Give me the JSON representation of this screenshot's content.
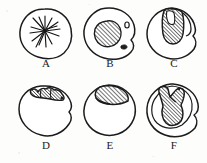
{
  "figure": {
    "background_color": "#fdfdfb",
    "ink_color": "#1b1b1b",
    "hatch_color": "#2a2a2a",
    "panel_count": 6,
    "rows": 2,
    "columns": 3,
    "label_font_style": "serif-capital"
  },
  "panels": [
    {
      "id": "A",
      "label": "A",
      "row": 1,
      "column": 1,
      "outline_shape": "irregular-rounded-circle",
      "content_name": "radiating-spindle-lines",
      "content_description": "cluster of straight lines radiating from a central point like an aster or spindle",
      "hatched": false,
      "satellite_marks": 0,
      "label_x": 46,
      "label_y": 63
    },
    {
      "id": "B",
      "label": "B",
      "row": 1,
      "column": 2,
      "outline_shape": "irregular-rounded-circle",
      "content_name": "central-hatched-blob",
      "content_description": "rounded diagonally hatched mass near the centre with two small satellite marks on the right",
      "hatched": true,
      "satellite_marks": 2,
      "label_x": 110,
      "label_y": 63
    },
    {
      "id": "C",
      "label": "C",
      "row": 1,
      "column": 3,
      "outline_shape": "irregular-circle-with-right-notch",
      "content_name": "hatched-vertical-column",
      "content_description": "hatched column descending from the top edge with a pale gap inside its upper left",
      "hatched": true,
      "satellite_marks": 0,
      "label_x": 174,
      "label_y": 63
    },
    {
      "id": "D",
      "label": "D",
      "row": 2,
      "column": 1,
      "outline_shape": "circle-with-right-indentation",
      "content_name": "scalloped-hatched-band",
      "content_description": "thin lobed hatched band hugging the upper arc",
      "hatched": true,
      "satellite_marks": 0,
      "label_x": 46,
      "label_y": 145
    },
    {
      "id": "E",
      "label": "E",
      "row": 2,
      "column": 2,
      "outline_shape": "rounded-circle",
      "content_name": "hatched-cap-wedge",
      "content_description": "broad hatched lens-shaped cap occupying the top of the outline",
      "hatched": true,
      "satellite_marks": 0,
      "label_x": 110,
      "label_y": 145
    },
    {
      "id": "F",
      "label": "F",
      "row": 2,
      "column": 3,
      "outline_shape": "irregular-circle-with-inner-contour",
      "content_name": "hatched-funnel-mass",
      "content_description": "large hatched funnel or vase shaped mass running from the top edge deep into the interior",
      "hatched": true,
      "satellite_marks": 0,
      "label_x": 174,
      "label_y": 145
    }
  ]
}
